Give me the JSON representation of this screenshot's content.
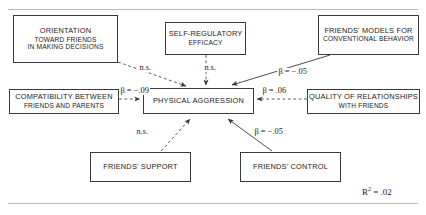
{
  "figure": {
    "r_squared_label": "R",
    "r_squared_exponent": "2",
    "r_squared_value": " = .02"
  },
  "nodes": {
    "orientation": {
      "name": "orientation-toward-friends",
      "line1": "Orientation",
      "line2": "toward friends",
      "line3": "in making decisions"
    },
    "efficacy": {
      "name": "self-regulatory-efficacy",
      "line1": "Self-regulatory",
      "line2": "efficacy"
    },
    "models": {
      "name": "friends-models-conventional-behavior",
      "line1": "Friends' models for",
      "line2": "conventional behavior"
    },
    "compatibility": {
      "name": "compatibility-friends-parents",
      "line1": "Compatibility between",
      "line2": "friends and parents"
    },
    "aggression": {
      "name": "physical-aggression",
      "line1": "Physical aggression"
    },
    "quality": {
      "name": "quality-of-relationships-with-friends",
      "line1": "Quality of relationships",
      "line2": "with friends"
    },
    "support": {
      "name": "friends-support",
      "line1": "Friends' support"
    },
    "control": {
      "name": "friends-control",
      "line1": "Friends' control"
    }
  },
  "edges": {
    "orientation_to_aggression": "n.s.",
    "efficacy_to_aggression": "n.s.",
    "models_to_aggression": "β = −.05",
    "compatibility_to_aggression": "β = −.09",
    "quality_to_aggression": "β = .06",
    "support_to_aggression": "n.s.",
    "control_to_aggression": "β = −.05"
  },
  "colors": {
    "box_border": "#3a3a3a",
    "path_stroke": "#3a3a3a",
    "rule": "#b9b9b9",
    "background": "#ffffff"
  }
}
